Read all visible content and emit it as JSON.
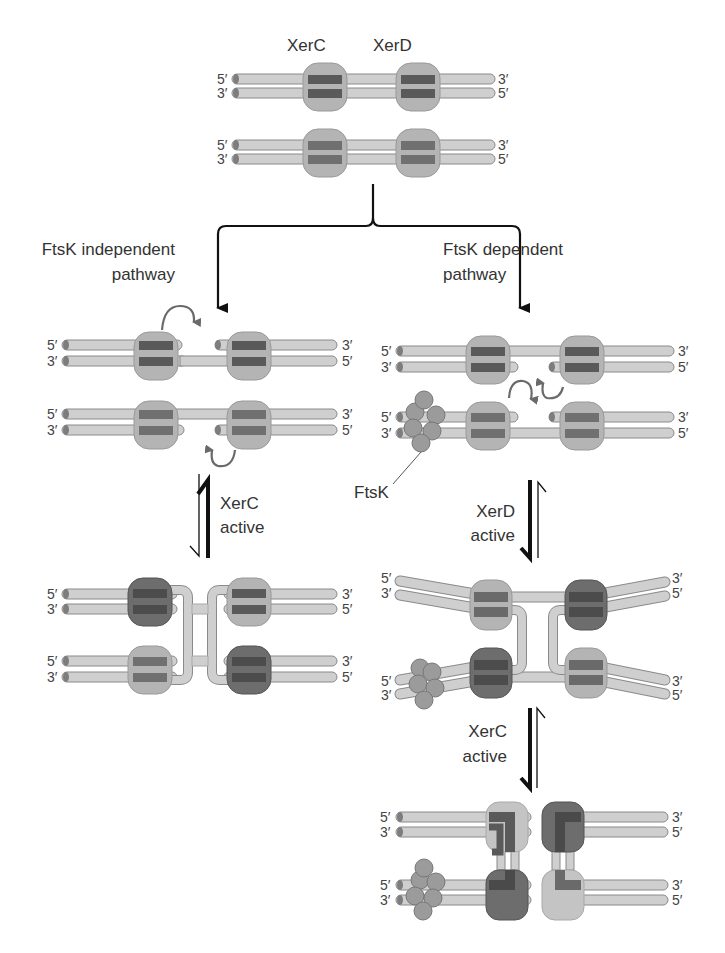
{
  "colors": {
    "strand_fill": "#cfcfcf",
    "strand_edge": "#8a8a8a",
    "strand_cap": "#7d7d7d",
    "protein_light": "#b4b4b4",
    "protein_dark": "#6d6d6d",
    "core_dark": "#5a5a5a",
    "exchange_arrow": "#6a6a6a",
    "flow_arrow": "#111111",
    "text": "#333333",
    "ftsk": "#9b9b9b"
  },
  "top": {
    "xerc_label": "XerC",
    "xerd_label": "XerD"
  },
  "ends": {
    "five": "5′",
    "three": "3′"
  },
  "pathways": {
    "left": {
      "line1": "FtsK independent",
      "line2": "pathway"
    },
    "right": {
      "line1": "FtsK dependent",
      "line2": "pathway"
    }
  },
  "steps": {
    "left_equilibrium": {
      "line1": "XerC",
      "line2": "active"
    },
    "right_equilibrium_1": {
      "line1": "XerD",
      "line2": "active"
    },
    "right_equilibrium_2": {
      "line1": "XerC",
      "line2": "active"
    }
  },
  "ftsk_label": "FtsK"
}
